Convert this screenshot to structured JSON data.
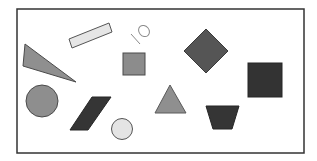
{
  "figure": {
    "background": "#ffffff",
    "frame": {
      "x": 17,
      "y": 9,
      "width": 287,
      "height": 144,
      "stroke": "#333333"
    },
    "annotation": {
      "text": "10",
      "color": "#8a8a8a"
    },
    "shapes": [
      {
        "id": "triangle-left",
        "kind": "triangle",
        "fill": "#8f8f8f",
        "stroke": "#4a4a4a"
      },
      {
        "id": "bar",
        "kind": "rectangle",
        "fill": "#e6e6e6",
        "stroke": "#555555"
      },
      {
        "id": "square-small",
        "kind": "square",
        "fill": "#8c8c8c",
        "stroke": "#4a4a4a"
      },
      {
        "id": "diamond",
        "kind": "diamond",
        "fill": "#555555",
        "stroke": "#3a3a3a"
      },
      {
        "id": "square-dark",
        "kind": "square",
        "fill": "#333333",
        "stroke": "#262626"
      },
      {
        "id": "circle-gray",
        "kind": "circle",
        "fill": "#8e8e8e",
        "stroke": "#4a4a4a"
      },
      {
        "id": "parallelogram",
        "kind": "parallelogram",
        "fill": "#353535",
        "stroke": "#262626"
      },
      {
        "id": "circle-light",
        "kind": "circle",
        "fill": "#e4e4e4",
        "stroke": "#555555"
      },
      {
        "id": "triangle-center",
        "kind": "triangle",
        "fill": "#8f8f8f",
        "stroke": "#5a5a5a"
      },
      {
        "id": "trapezoid",
        "kind": "trapezoid",
        "fill": "#353535",
        "stroke": "#262626"
      }
    ]
  }
}
